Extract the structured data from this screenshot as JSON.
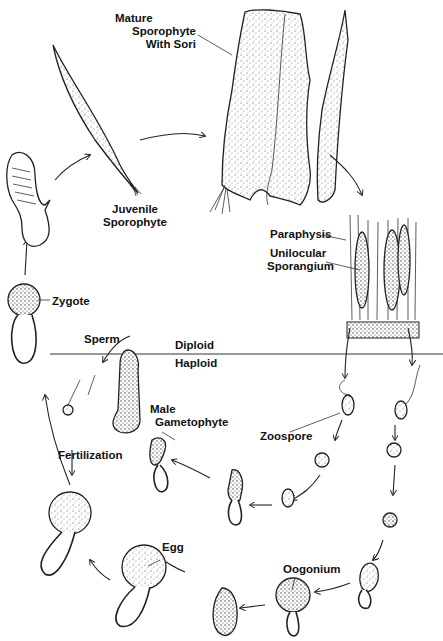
{
  "diagram": {
    "divider": {
      "above": "Diploid",
      "below": "Haploid"
    },
    "labels": {
      "mature_sporophyte": [
        "Mature",
        "Sporophyte",
        "With Sori"
      ],
      "juvenile_sporophyte": [
        "Juvenile",
        "Sporophyte"
      ],
      "paraphysis": "Paraphysis",
      "unilocular_sporangium": [
        "Unilocular",
        "Sporangium"
      ],
      "zygote": "Zygote",
      "sperm": "Sperm",
      "male_gametophyte": [
        "Male",
        "Gametophyte"
      ],
      "zoospore": "Zoospore",
      "fertilization": "Fertilization",
      "egg": "Egg",
      "oogonium": "Oogonium"
    },
    "stages_cycle_order": [
      "Mature Sporophyte With Sori",
      "Sorus (Paraphysis + Unilocular Sporangium)",
      "Zoospore",
      "Male Gametophyte / Oogonium",
      "Sperm / Egg",
      "Fertilization",
      "Zygote",
      "Young sporophyte",
      "Juvenile Sporophyte"
    ],
    "colors": {
      "ink": "#222222",
      "background": "#ffffff"
    }
  }
}
